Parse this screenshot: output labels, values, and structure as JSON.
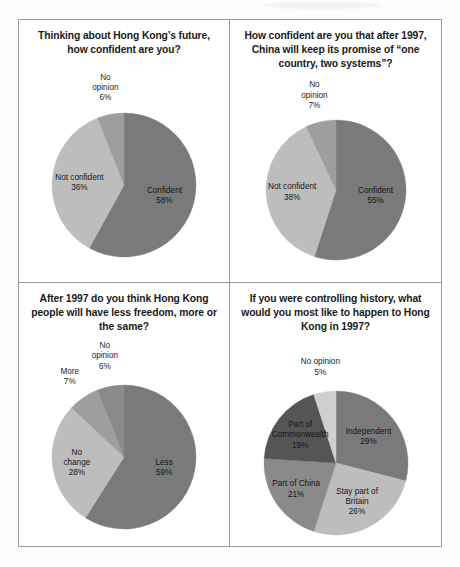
{
  "page": {
    "background_color": "#fdfdfd",
    "frame_border_color": "#9a9a9a"
  },
  "palette": {
    "dark": "#7a7a7a",
    "darker": "#555555",
    "medium": "#8a8a8a",
    "medium_light": "#9e9e9e",
    "light": "#bdbdbd",
    "lighter": "#cfcfcf"
  },
  "charts": [
    {
      "id": "chart-confidence-future",
      "title": "Thinking about Hong Kong’s future, how confident are you?",
      "chart_data": {
        "type": "pie",
        "title": "Thinking about Hong Kong’s future, how confident are you?",
        "categories": [
          "Confident",
          "Not confident",
          "No opinion"
        ],
        "values": [
          58,
          36,
          6
        ],
        "unit": "%",
        "legend": "none",
        "labels": [
          "Confident\n58%",
          "Not confident\n36%",
          "No\nopinion\n6%"
        ],
        "colors": [
          "#7a7a7a",
          "#bdbdbd",
          "#9e9e9e"
        ],
        "start_angle_deg": 0
      }
    },
    {
      "id": "chart-one-country-two-systems",
      "title": "How confident are you that after 1997, China will keep its promise of “one country, two systems”?",
      "chart_data": {
        "type": "pie",
        "title": "How confident are you that after 1997, China will keep its promise of “one country, two systems”?",
        "categories": [
          "Confident",
          "Not confident",
          "No opinion"
        ],
        "values": [
          55,
          38,
          7
        ],
        "unit": "%",
        "legend": "none",
        "labels": [
          "Confident\n55%",
          "Not confident\n38%",
          "No\nopinion\n7%"
        ],
        "colors": [
          "#7a7a7a",
          "#bdbdbd",
          "#9e9e9e"
        ],
        "start_angle_deg": 0
      }
    },
    {
      "id": "chart-freedom-after-1997",
      "title": "After 1997 do you think Hong Kong people will have less freedom, more or the same?",
      "chart_data": {
        "type": "pie",
        "title": "After 1997 do you think Hong Kong people will have less freedom, more or the same?",
        "categories": [
          "Less",
          "No change",
          "More",
          "No opinion"
        ],
        "values": [
          59,
          28,
          7,
          6
        ],
        "unit": "%",
        "legend": "none",
        "labels": [
          "Less\n59%",
          "No\nchange\n28%",
          "More\n7%",
          "No\nopinion\n6%"
        ],
        "colors": [
          "#7a7a7a",
          "#bdbdbd",
          "#9e9e9e",
          "#8a8a8a"
        ],
        "start_angle_deg": 0
      }
    },
    {
      "id": "chart-controlling-history",
      "title": "If you were controlling history, what would you most like to happen to Hong Kong in 1997?",
      "chart_data": {
        "type": "pie",
        "title": "If you were controlling history, what would you most like to happen to Hong Kong in 1997?",
        "categories": [
          "Independent",
          "Stay part of Britain",
          "Part of China",
          "Part of Commonwealth",
          "No opinion"
        ],
        "values": [
          29,
          26,
          21,
          19,
          5
        ],
        "unit": "%",
        "legend": "none",
        "labels": [
          "Independent\n29%",
          "Stay part of\nBritain\n26%",
          "Part of China\n21%",
          "Part of\nCommonwealth\n19%",
          "No opinion\n5%"
        ],
        "colors": [
          "#7a7a7a",
          "#bdbdbd",
          "#8a8a8a",
          "#555555",
          "#cfcfcf"
        ],
        "start_angle_deg": 0
      }
    }
  ]
}
